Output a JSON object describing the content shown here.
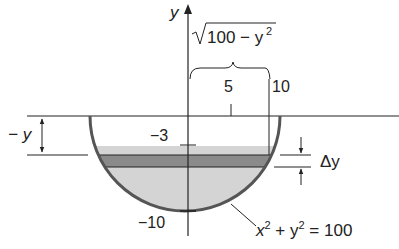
{
  "figure": {
    "axis_label_y": "y",
    "sqrt_expr": "100 − y",
    "sqrt_exp": "2",
    "tick_5": "5",
    "tick_10": "10",
    "tick_neg3": "−3",
    "tick_neg10": "−10",
    "depth_label": "− y",
    "delta_label": "Δy",
    "circle_eq_x": "x",
    "circle_eq_mid": " + y",
    "circle_eq_end": " = 100",
    "circle_eq_exp": "2"
  },
  "colors": {
    "light_fill": "#d4d4d4",
    "strip_fill": "#8a8a8a",
    "bowl_stroke": "#555555",
    "line": "#222222"
  }
}
